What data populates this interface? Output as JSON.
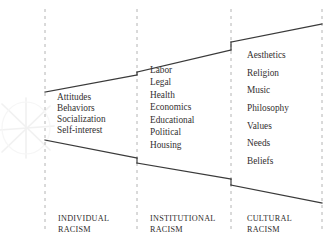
{
  "diagram": {
    "type": "nested-expanding-bands",
    "background_color": "#ffffff",
    "line_color": "#3a3a3a",
    "dashed_divider_color": "#b4b4b4",
    "watermark": {
      "name": "star-watermark",
      "color": "#e8e8e8",
      "position": "left-middle"
    },
    "dividers": [
      {
        "name": "divider-1",
        "x": 45
      },
      {
        "name": "divider-2",
        "x": 137
      },
      {
        "name": "divider-3",
        "x": 231
      },
      {
        "name": "divider-4",
        "x": 322
      }
    ],
    "columns": [
      {
        "key": "individual",
        "footer_line1": "INDIVIDUAL",
        "footer_line2": "RACISM",
        "terms": [
          "Attitudes",
          "Behaviors",
          "Socialization",
          "Self-interest"
        ],
        "top_boundary": {
          "x1": 45,
          "y1": 92,
          "x2": 137,
          "y2": 75
        },
        "bottom_boundary": {
          "x1": 45,
          "y1": 140,
          "x2": 137,
          "y2": 158
        }
      },
      {
        "key": "institutional",
        "footer_line1": "INSTITUTIONAL",
        "footer_line2": "RACISM",
        "terms": [
          "Labor",
          "Legal",
          "Health",
          "Economics",
          "Educational",
          "Political",
          "Housing"
        ],
        "top_boundary": {
          "x1": 137,
          "y1": 72,
          "x2": 231,
          "y2": 50
        },
        "bottom_boundary": {
          "x1": 137,
          "y1": 163,
          "x2": 231,
          "y2": 179
        }
      },
      {
        "key": "cultural",
        "footer_line1": "CULTURAL",
        "footer_line2": "RACISM",
        "terms": [
          "Aesthetics",
          "Religion",
          "Music",
          "Philosophy",
          "Values",
          "Needs",
          "Beliefs"
        ],
        "top_boundary": {
          "x1": 231,
          "y1": 42,
          "x2": 322,
          "y2": 24
        },
        "bottom_boundary": {
          "x1": 231,
          "y1": 185,
          "x2": 322,
          "y2": 203
        }
      }
    ]
  }
}
